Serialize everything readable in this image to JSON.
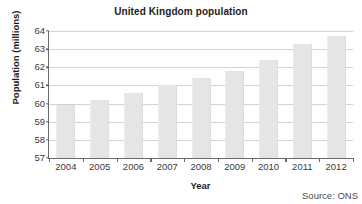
{
  "chart_data": {
    "type": "bar",
    "title": "United Kingdom population",
    "xlabel": "Year",
    "ylabel": "Population (millions)",
    "categories": [
      "2004",
      "2005",
      "2006",
      "2007",
      "2008",
      "2009",
      "2010",
      "2011",
      "2012"
    ],
    "values": [
      59.9,
      60.2,
      60.6,
      61.0,
      61.4,
      61.8,
      62.4,
      63.3,
      63.7
    ],
    "ylim": [
      57,
      64
    ],
    "yticks": [
      57,
      58,
      59,
      60,
      61,
      62,
      63,
      64
    ],
    "ytick_labels": [
      "57",
      "58",
      "59",
      "60",
      "61",
      "62",
      "63",
      "64"
    ],
    "grid": true,
    "legend": "none",
    "series_name": "Population",
    "bar_color": "#e5e5e5",
    "axis_color": "#6a6a6a",
    "grid_color": "#d3d3d3",
    "annotations": [
      "Source: ONS"
    ]
  },
  "footer": {
    "source": "Source: ONS"
  }
}
